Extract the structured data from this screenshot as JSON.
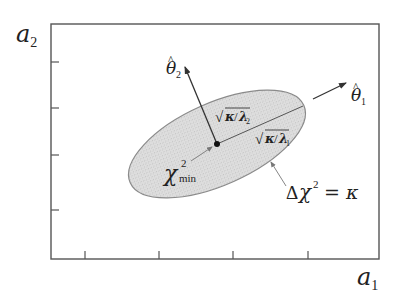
{
  "diagram": {
    "type": "confidence-ellipse",
    "axes": {
      "x_label": {
        "base": "a",
        "sub": "1"
      },
      "y_label": {
        "base": "a",
        "sub": "2"
      },
      "frame": {
        "x0": 51,
        "y0": 24,
        "x1": 379,
        "y1": 259
      },
      "x_ticks_px": [
        85,
        159,
        233,
        308
      ],
      "y_ticks_px": [
        62,
        108,
        155,
        210
      ]
    },
    "ellipse": {
      "cx": 217,
      "cy": 144,
      "rx": 95,
      "ry": 41,
      "angle_deg": -24,
      "fill": "#d9d9d9",
      "stroke": "#8a8a8a",
      "boundary_label": {
        "prefix": "Δ",
        "chi": "χ",
        "sup": "2",
        "rest": " = κ"
      }
    },
    "minimum": {
      "label": {
        "chi": "χ",
        "sup": "2",
        "sub": "min"
      }
    },
    "eigenvectors": {
      "theta1": {
        "base": "θ",
        "hat": "^",
        "sub": "1"
      },
      "theta2": {
        "base": "θ",
        "hat": "^",
        "sub": "2"
      }
    },
    "semi_axes": {
      "major": {
        "radical": "√",
        "numerator": "κ",
        "slash": "/",
        "lambda": "λ",
        "sub": "1"
      },
      "minor": {
        "radical": "√",
        "numerator": "κ",
        "slash": "/",
        "lambda": "λ",
        "sub": "2"
      }
    },
    "colors": {
      "axis": "#555555",
      "text": "#222222",
      "arrow": "#333333"
    }
  }
}
